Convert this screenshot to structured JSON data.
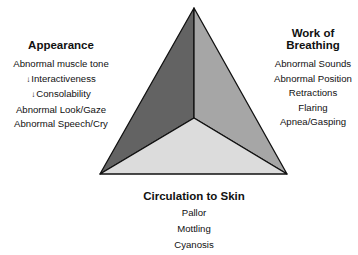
{
  "diagram": {
    "type": "pediatric-assessment-triangle",
    "colors": {
      "appearance_face": "#636363",
      "breathing_face": "#a6a6a6",
      "circulation_face": "#dcdcdc",
      "outline": "#111111",
      "text": "#111111"
    },
    "appearance": {
      "title": "Appearance",
      "items": [
        {
          "arrow": "",
          "text": "Abnormal muscle tone"
        },
        {
          "arrow": "↓",
          "text": "Interactiveness"
        },
        {
          "arrow": "↓",
          "text": "Consolability"
        },
        {
          "arrow": "",
          "text": "Abnormal Look/Gaze"
        },
        {
          "arrow": "",
          "text": "Abnormal Speech/Cry"
        }
      ]
    },
    "work_of_breathing": {
      "title_line1": "Work of",
      "title_line2": "Breathing",
      "items": [
        "Abnormal Sounds",
        "Abnormal Position",
        "Retractions",
        "Flaring",
        "Apnea/Gasping"
      ]
    },
    "circulation_to_skin": {
      "title": "Circulation to Skin",
      "items": [
        "Pallor",
        "Mottling",
        "Cyanosis"
      ]
    }
  }
}
